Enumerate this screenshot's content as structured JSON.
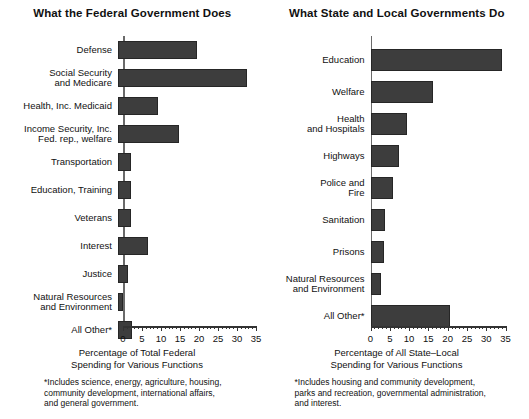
{
  "chart_data": [
    {
      "type": "bar",
      "orientation": "horizontal",
      "title": "What the Federal Government Does",
      "xlabel": "Percentage of Total Federal\nSpending for Various Functions",
      "ylabel": "",
      "xlim": [
        0,
        35
      ],
      "xticks": [
        0,
        5,
        10,
        15,
        20,
        25,
        30,
        35
      ],
      "xtick_labels": [
        "0",
        "5",
        "10",
        "15",
        "20",
        "25",
        "30",
        "35"
      ],
      "minor_tick_step": 1,
      "grid": false,
      "legend": "none",
      "bar_color": "#3d3d3d",
      "categories": [
        "Defense",
        "Social Security\nand Medicare",
        "Health, Inc. Medicaid",
        "Income Security, Inc.\nFed. rep., welfare",
        "Transportation",
        "Education, Training",
        "Veterans",
        "Interest",
        "Justice",
        "Natural Resources\nand Environment",
        "All Other*"
      ],
      "values": [
        20.8,
        34.0,
        10.5,
        16.0,
        3.5,
        3.5,
        3.5,
        8.0,
        2.6,
        1.3,
        3.6
      ],
      "footnote": "*Includes science, energy, agriculture, housing,\ncommunity development, international affairs,\nand general government."
    },
    {
      "type": "bar",
      "orientation": "horizontal",
      "title": "What State and Local Governments Do",
      "xlabel": "Percentage of All State–Local\nSpending for Various Functions",
      "ylabel": "",
      "xlim": [
        0,
        35
      ],
      "xticks": [
        0,
        5,
        10,
        15,
        20,
        25,
        30,
        35
      ],
      "xtick_labels": [
        "0",
        "5",
        "10",
        "15",
        "20",
        "25",
        "30",
        "35"
      ],
      "minor_tick_step": 1,
      "grid": false,
      "legend": "none",
      "bar_color": "#3d3d3d",
      "categories": [
        "Education",
        "Welfare",
        "Health\nand Hospitals",
        "Highways",
        "Police and\nFire",
        "Sanitation",
        "Prisons",
        "Natural Resources\nand Environment",
        "All Other*"
      ],
      "values": [
        34.0,
        16.0,
        9.3,
        7.3,
        5.7,
        3.6,
        3.4,
        2.6,
        20.5
      ],
      "footnote": "*Includes housing and community development,\nparks and recreation, governmental administration,\nand interest."
    }
  ]
}
